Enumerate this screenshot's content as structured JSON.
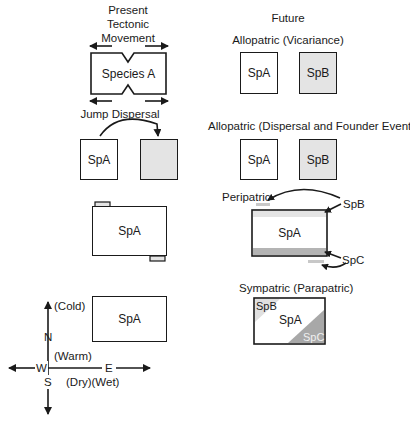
{
  "present": {
    "title_lines": [
      "Present",
      "Tectonic",
      "Movement"
    ],
    "tectonic_box_label": "Species A",
    "jump_dispersal": {
      "title": "Jump Dispersal",
      "box_a": "SpA",
      "box_b": ""
    },
    "peripheral_box_label": "SpA",
    "compass_box_label": "SpA",
    "compass": {
      "north": "N",
      "south": "S",
      "east": "E",
      "west": "W",
      "cold": "(Cold)",
      "warm": "(Warm)",
      "dry_wet": "(Dry)(Wet)"
    }
  },
  "future": {
    "title": "Future",
    "vicariance": {
      "title": "Allopatric (Vicariance)",
      "box_a": "SpA",
      "box_b": "SpB"
    },
    "dispersal": {
      "title": "Allopatric (Dispersal and Founder Event)",
      "box_a": "SpA",
      "box_b": "SpB"
    },
    "peripatric": {
      "title": "Peripatric",
      "box": "SpA",
      "label_b": "SpB",
      "label_c": "SpC"
    },
    "sympatric": {
      "title": "Sympatric (Parapatric)",
      "label_a": "SpA",
      "label_b": "SpB",
      "label_c": "SpC"
    }
  },
  "colors": {
    "line": "#1a1a1a",
    "shade_light": "#e4e4e4",
    "shade_mid": "#c8c8c8",
    "shade_dark": "#a8a8a8"
  }
}
